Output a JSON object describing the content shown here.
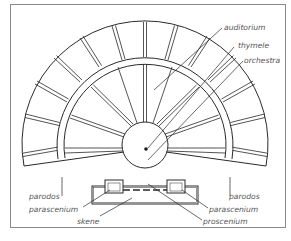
{
  "diagram": {
    "type": "greek-theatre-plan",
    "labels": {
      "auditorium": "auditorium",
      "thymele": "thymele",
      "orchestra": "orchestra",
      "parodos_left": "parodos",
      "parodos_right": "parodos",
      "parascenium_left": "parascenium",
      "parascenium_right": "parascenium",
      "skene": "skene",
      "proscenium": "proscenium"
    },
    "colors": {
      "line": "#2a2a2a",
      "label": "#555555",
      "frame": "#8a8a8a"
    }
  }
}
